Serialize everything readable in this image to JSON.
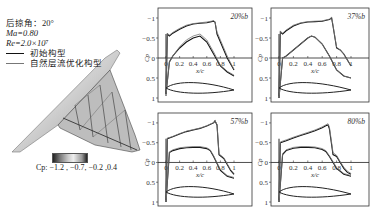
{
  "legend": {
    "sweep_label": "后掠角：20°",
    "mach_label": "Ma=0.80",
    "re_label": "Re=2.0×10⁷",
    "items": [
      {
        "label": "初始构型",
        "color": "#111111"
      },
      {
        "label": "自然层流优化构型",
        "color": "#777777"
      }
    ]
  },
  "colorbar": {
    "label": "Cp: −1.2 , −0.7, −0.2 ,0.4",
    "ticks": [
      -1.2,
      -0.7,
      -0.2,
      0.4
    ]
  },
  "chart_data": [
    {
      "type": "line",
      "title": "20%b",
      "xlabel": "x/c",
      "ylabel": "Cp",
      "xlim": [
        0,
        1
      ],
      "ylim": [
        1,
        -1.2
      ],
      "invert_y": true,
      "xticks": [
        0,
        0.2,
        0.4,
        0.6,
        0.8,
        1
      ],
      "yticks": [
        -1,
        -0.5,
        0,
        0.5,
        1
      ],
      "series": [
        {
          "name": "初始构型 upper",
          "x": [
            0,
            0.02,
            0.05,
            0.1,
            0.2,
            0.3,
            0.4,
            0.5,
            0.6,
            0.7,
            0.72,
            0.75,
            0.8,
            0.85,
            0.9,
            0.95,
            1
          ],
          "y": [
            0.9,
            -0.6,
            -0.55,
            -0.62,
            -0.72,
            -0.8,
            -0.85,
            -0.87,
            -0.88,
            -0.92,
            -0.9,
            -0.6,
            -0.4,
            -0.2,
            0.0,
            0.15,
            0.3
          ]
        },
        {
          "name": "初始构型 lower",
          "x": [
            0,
            0.05,
            0.1,
            0.2,
            0.3,
            0.4,
            0.5,
            0.6,
            0.7,
            0.8,
            0.9,
            1
          ],
          "y": [
            0.9,
            0.1,
            -0.05,
            -0.25,
            -0.4,
            -0.5,
            -0.55,
            -0.4,
            -0.1,
            0.2,
            0.35,
            0.45
          ]
        },
        {
          "name": "自然层流优化构型 upper",
          "x": [
            0,
            0.02,
            0.05,
            0.1,
            0.2,
            0.3,
            0.4,
            0.5,
            0.6,
            0.7,
            0.72,
            0.75,
            0.8,
            0.85,
            0.9,
            0.95,
            1
          ],
          "y": [
            0.9,
            -0.62,
            -0.57,
            -0.64,
            -0.74,
            -0.82,
            -0.86,
            -0.88,
            -0.9,
            -0.93,
            -0.9,
            -0.65,
            -0.45,
            -0.25,
            -0.05,
            0.12,
            0.28
          ]
        },
        {
          "name": "自然层流优化构型 lower",
          "x": [
            0,
            0.05,
            0.1,
            0.2,
            0.3,
            0.4,
            0.5,
            0.6,
            0.7,
            0.8,
            0.9,
            1
          ],
          "y": [
            0.9,
            0.1,
            -0.05,
            -0.28,
            -0.45,
            -0.55,
            -0.6,
            -0.45,
            -0.15,
            0.18,
            0.33,
            0.43
          ]
        }
      ]
    },
    {
      "type": "line",
      "title": "37%b",
      "xlabel": "x/c",
      "ylabel": "Cp",
      "xlim": [
        0,
        1
      ],
      "ylim": [
        1,
        -1.2
      ],
      "invert_y": true,
      "xticks": [
        0,
        0.2,
        0.4,
        0.6,
        0.8,
        1
      ],
      "yticks": [
        -1,
        -0.5,
        0,
        0.5,
        1
      ],
      "series": [
        {
          "name": "初始构型 upper",
          "x": [
            0,
            0.02,
            0.05,
            0.1,
            0.2,
            0.3,
            0.4,
            0.5,
            0.6,
            0.7,
            0.73,
            0.75,
            0.8,
            0.85,
            0.9,
            0.95,
            1
          ],
          "y": [
            1.0,
            -0.65,
            -0.6,
            -0.68,
            -0.8,
            -0.87,
            -0.9,
            -0.91,
            -0.92,
            -0.96,
            -1.0,
            -0.8,
            -0.25,
            -0.2,
            -0.1,
            0.05,
            0.2
          ]
        },
        {
          "name": "初始构型 lower",
          "x": [
            0,
            0.05,
            0.1,
            0.2,
            0.3,
            0.4,
            0.45,
            0.5,
            0.6,
            0.7,
            0.8,
            0.9,
            1
          ],
          "y": [
            1.0,
            0.0,
            -0.05,
            -0.2,
            -0.35,
            -0.5,
            -0.55,
            -0.52,
            -0.35,
            -0.05,
            0.3,
            0.45,
            0.5
          ]
        },
        {
          "name": "自然层流优化构型 upper",
          "x": [
            0,
            0.02,
            0.05,
            0.1,
            0.2,
            0.3,
            0.4,
            0.5,
            0.6,
            0.7,
            0.73,
            0.75,
            0.8,
            0.85,
            0.9,
            0.95,
            1
          ],
          "y": [
            1.0,
            -0.67,
            -0.62,
            -0.7,
            -0.82,
            -0.88,
            -0.91,
            -0.92,
            -0.93,
            -0.97,
            -1.02,
            -0.82,
            -0.27,
            -0.2,
            -0.1,
            0.05,
            0.2
          ]
        },
        {
          "name": "自然层流优化构型 lower",
          "x": [
            0,
            0.05,
            0.1,
            0.2,
            0.3,
            0.4,
            0.45,
            0.5,
            0.6,
            0.7,
            0.8,
            0.9,
            1
          ],
          "y": [
            1.0,
            0.0,
            -0.05,
            -0.2,
            -0.35,
            -0.5,
            -0.55,
            -0.52,
            -0.35,
            -0.05,
            0.3,
            0.45,
            0.5
          ]
        }
      ]
    },
    {
      "type": "line",
      "title": "57%b",
      "xlabel": "x/c",
      "ylabel": "Cp",
      "xlim": [
        0,
        1
      ],
      "ylim": [
        1,
        -1.2
      ],
      "invert_y": true,
      "xticks": [
        0,
        0.2,
        0.4,
        0.6,
        0.8,
        1
      ],
      "yticks": [
        -1,
        -0.5,
        0,
        0.5,
        1
      ],
      "series": [
        {
          "name": "初始构型 upper",
          "x": [
            0,
            0.02,
            0.05,
            0.1,
            0.2,
            0.3,
            0.4,
            0.5,
            0.6,
            0.7,
            0.72,
            0.75,
            0.78,
            0.85,
            0.9,
            0.95,
            1
          ],
          "y": [
            1.0,
            -0.6,
            -0.62,
            -0.65,
            -0.72,
            -0.78,
            -0.82,
            -0.86,
            -0.92,
            -1.0,
            -1.05,
            -0.95,
            -0.2,
            -0.1,
            0.05,
            0.2,
            0.3
          ]
        },
        {
          "name": "初始构型 lower",
          "x": [
            0,
            0.05,
            0.1,
            0.2,
            0.3,
            0.4,
            0.5,
            0.6,
            0.65,
            0.7,
            0.8,
            0.9,
            1
          ],
          "y": [
            1.0,
            -0.25,
            -0.3,
            -0.35,
            -0.37,
            -0.38,
            -0.38,
            -0.35,
            -0.3,
            -0.15,
            0.2,
            0.35,
            0.4
          ]
        },
        {
          "name": "自然层流优化构型 upper",
          "x": [
            0,
            0.02,
            0.05,
            0.1,
            0.2,
            0.3,
            0.4,
            0.5,
            0.6,
            0.7,
            0.72,
            0.75,
            0.78,
            0.85,
            0.9,
            0.95,
            1
          ],
          "y": [
            1.0,
            -0.62,
            -0.63,
            -0.66,
            -0.73,
            -0.79,
            -0.83,
            -0.87,
            -0.93,
            -1.01,
            -1.06,
            -0.96,
            -0.22,
            -0.12,
            0.03,
            0.18,
            0.28
          ]
        },
        {
          "name": "自然层流优化构型 lower",
          "x": [
            0,
            0.05,
            0.1,
            0.2,
            0.3,
            0.4,
            0.5,
            0.6,
            0.65,
            0.7,
            0.8,
            0.9,
            1
          ],
          "y": [
            1.0,
            -0.27,
            -0.32,
            -0.37,
            -0.39,
            -0.4,
            -0.4,
            -0.37,
            -0.32,
            -0.17,
            0.18,
            0.33,
            0.38
          ]
        }
      ]
    },
    {
      "type": "line",
      "title": "80%b",
      "xlabel": "x/c",
      "ylabel": "Cp",
      "xlim": [
        0,
        1
      ],
      "ylim": [
        1,
        -1.2
      ],
      "invert_y": true,
      "xticks": [
        0,
        0.2,
        0.4,
        0.6,
        0.8,
        1
      ],
      "yticks": [
        -1,
        -0.5,
        0,
        0.5,
        1
      ],
      "series": [
        {
          "name": "初始构型 upper",
          "x": [
            0,
            0.02,
            0.05,
            0.1,
            0.2,
            0.3,
            0.4,
            0.5,
            0.6,
            0.65,
            0.68,
            0.7,
            0.75,
            0.8,
            0.85,
            0.9,
            0.95,
            1
          ],
          "y": [
            1.0,
            -0.5,
            -0.52,
            -0.55,
            -0.62,
            -0.68,
            -0.74,
            -0.8,
            -0.88,
            -0.93,
            -0.95,
            -0.85,
            -0.2,
            -0.15,
            0.0,
            0.15,
            0.25,
            0.3
          ]
        },
        {
          "name": "初始构型 lower",
          "x": [
            0,
            0.05,
            0.1,
            0.2,
            0.3,
            0.4,
            0.5,
            0.6,
            0.65,
            0.7,
            0.8,
            0.9,
            1
          ],
          "y": [
            1.0,
            -0.2,
            -0.3,
            -0.36,
            -0.38,
            -0.38,
            -0.37,
            -0.33,
            -0.28,
            -0.15,
            0.15,
            0.3,
            0.35
          ]
        },
        {
          "name": "自然层流优化构型 upper",
          "x": [
            0,
            0.02,
            0.05,
            0.1,
            0.2,
            0.3,
            0.4,
            0.5,
            0.6,
            0.65,
            0.68,
            0.7,
            0.75,
            0.8,
            0.85,
            0.9,
            0.95,
            1
          ],
          "y": [
            1.0,
            -0.52,
            -0.54,
            -0.57,
            -0.64,
            -0.7,
            -0.76,
            -0.82,
            -0.9,
            -0.95,
            -0.98,
            -0.9,
            -0.25,
            -0.18,
            -0.02,
            0.12,
            0.22,
            0.28
          ]
        },
        {
          "name": "自然层流优化构型 lower",
          "x": [
            0,
            0.05,
            0.1,
            0.2,
            0.3,
            0.4,
            0.5,
            0.6,
            0.65,
            0.7,
            0.8,
            0.9,
            1
          ],
          "y": [
            1.0,
            -0.22,
            -0.32,
            -0.38,
            -0.4,
            -0.4,
            -0.39,
            -0.35,
            -0.3,
            -0.17,
            0.13,
            0.28,
            0.33
          ]
        }
      ]
    }
  ]
}
